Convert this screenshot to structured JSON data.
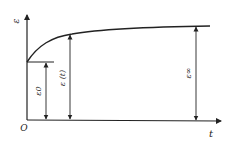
{
  "diagram": {
    "y_axis_label": "ε",
    "x_axis_label": "t",
    "origin_label": "O",
    "annotations": [
      {
        "name": "initial-strain",
        "label": "ε0"
      },
      {
        "name": "strain-at-t",
        "label": "ε (t)"
      },
      {
        "name": "final-strain",
        "label": "ε∞"
      }
    ],
    "colors": {
      "line": "#222222",
      "background": "#ffffff"
    }
  }
}
